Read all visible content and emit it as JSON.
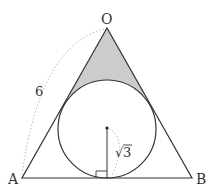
{
  "diagram": {
    "type": "geometry",
    "vertices": {
      "O": {
        "label": "O"
      },
      "A": {
        "label": "A"
      },
      "B": {
        "label": "B"
      }
    },
    "side_length_label": "6",
    "radius_label": "√3",
    "radius_sqrt_symbol": "√",
    "radius_value": "3",
    "colors": {
      "stroke": "#333333",
      "shade": "#cccccc",
      "dashed": "#aaaaaa"
    }
  }
}
